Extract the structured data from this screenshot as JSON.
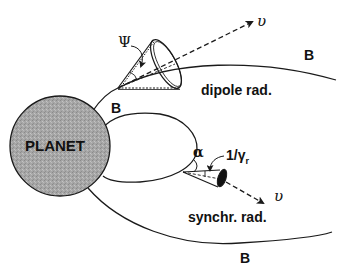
{
  "diagram": {
    "planet": {
      "label": "PLANET",
      "fill": "#a9a9a9"
    },
    "field_labels": {
      "b_top": "B",
      "b_inner": "B",
      "b_bottom": "B"
    },
    "dipole": {
      "label": "dipole rad.",
      "cone_angle_symbol": "Ψ",
      "velocity_symbol": "υ"
    },
    "synchrotron": {
      "label": "synchr. rad.",
      "pitch_angle_symbol": "α",
      "cone_angle_symbol": "1/γ",
      "cone_angle_subscript": "r",
      "velocity_symbol": "υ"
    },
    "colors": {
      "line": "#1a1a1a",
      "background": "#ffffff",
      "planet_fill": "#a9a9a9",
      "cone_cap": "#111111"
    }
  }
}
